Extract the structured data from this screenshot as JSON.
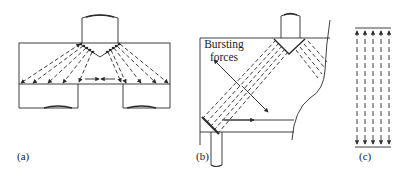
{
  "figure": {
    "panels": [
      {
        "id": "a",
        "label": "(a)",
        "description": "Deep beam with stub column load fanning to two supports; horizontal tie with opposing arrows"
      },
      {
        "id": "b",
        "label": "(b)",
        "description": "Corner/corbel region with compression fans and bursting forces"
      },
      {
        "id": "c",
        "label": "(c)",
        "description": "Uniform compression field between two plates"
      }
    ],
    "annotations": {
      "bursting_forces_line1": "Bursting",
      "bursting_forces_line2": "forces"
    },
    "colors": {
      "line": "#2a2a2a",
      "background": "#ffffff"
    }
  }
}
